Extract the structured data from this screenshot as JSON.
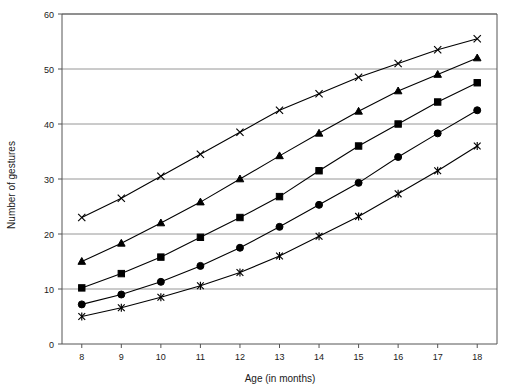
{
  "chart_data": {
    "type": "line",
    "title": "",
    "xlabel": "Age (in months)",
    "ylabel": "Number of gestures",
    "x": [
      8,
      9,
      10,
      11,
      12,
      13,
      14,
      15,
      16,
      17,
      18
    ],
    "xtick_labels": [
      "8",
      "9",
      "10",
      "11",
      "12",
      "13",
      "14",
      "15",
      "16",
      "17",
      "18"
    ],
    "ytick_labels": [
      "0",
      "10",
      "20",
      "30",
      "40",
      "50",
      "60"
    ],
    "yticks": [
      0,
      10,
      20,
      30,
      40,
      50,
      60
    ],
    "xlim": [
      7.5,
      18.5
    ],
    "ylim": [
      0,
      60
    ],
    "grid": "horizontal",
    "legend": "none",
    "series": [
      {
        "name": "series-1",
        "marker": "x",
        "values": [
          23.0,
          26.5,
          30.5,
          34.5,
          38.5,
          42.5,
          45.5,
          48.5,
          51.0,
          53.5,
          55.5
        ]
      },
      {
        "name": "series-2",
        "marker": "triangle",
        "values": [
          15.0,
          18.3,
          22.0,
          25.8,
          30.0,
          34.2,
          38.3,
          42.3,
          46.0,
          49.0,
          52.0
        ]
      },
      {
        "name": "series-3",
        "marker": "square",
        "values": [
          10.2,
          12.8,
          15.8,
          19.4,
          23.0,
          26.8,
          31.5,
          36.0,
          40.0,
          44.0,
          47.5
        ]
      },
      {
        "name": "series-4",
        "marker": "circle",
        "values": [
          7.2,
          9.0,
          11.3,
          14.2,
          17.5,
          21.3,
          25.3,
          29.3,
          34.0,
          38.3,
          42.5
        ]
      },
      {
        "name": "series-5",
        "marker": "asterisk",
        "values": [
          5.0,
          6.6,
          8.5,
          10.6,
          13.0,
          16.0,
          19.6,
          23.2,
          27.3,
          31.5,
          36.0
        ]
      }
    ]
  },
  "colors": {
    "line": "#000000",
    "grid": "#8a8a8a",
    "axis": "#555555",
    "background": "#ffffff",
    "text": "#1a1a1a"
  }
}
